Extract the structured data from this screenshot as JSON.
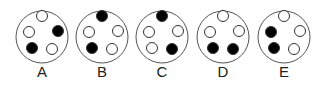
{
  "figure": {
    "outer": {
      "radius": 26,
      "stroke": "#555555",
      "fill": "#ffffff"
    },
    "dot": {
      "radius": 5.5,
      "stroke": "#333333",
      "filled_color": "#000000",
      "empty_color": "#ffffff"
    },
    "positions": {
      "top": [
        0,
        -21
      ],
      "right": [
        16,
        -6
      ],
      "bottom_right": [
        10,
        12
      ],
      "bottom_left": [
        -10,
        11
      ],
      "left": [
        -13,
        -5
      ]
    },
    "options": [
      {
        "label": "A",
        "cx": 42,
        "cy": 37,
        "filled": [
          "right",
          "bottom_left"
        ]
      },
      {
        "label": "B",
        "cx": 102,
        "cy": 37,
        "filled": [
          "top",
          "bottom_left"
        ]
      },
      {
        "label": "C",
        "cx": 162,
        "cy": 37,
        "filled": [
          "top",
          "bottom_right"
        ]
      },
      {
        "label": "D",
        "cx": 223,
        "cy": 37,
        "filled": [
          "bottom_left",
          "bottom_right"
        ]
      },
      {
        "label": "E",
        "cx": 284,
        "cy": 37,
        "filled": [
          "left",
          "bottom_left"
        ]
      }
    ]
  }
}
